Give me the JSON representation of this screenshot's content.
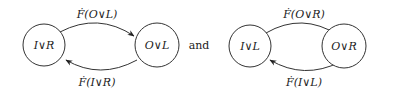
{
  "diagrams": [
    {
      "nodes": [
        {
          "label": "I∨R"
        },
        {
          "label": "O∨L"
        }
      ],
      "edges": [
        {
          "label": "Ḟ(O∨L)",
          "from": "I∨R",
          "to": "O∨L"
        },
        {
          "label": "Ḟ(I∨R)",
          "from": "O∨L",
          "to": "I∨R"
        }
      ]
    },
    {
      "nodes": [
        {
          "label": "I∨L"
        },
        {
          "label": "O∨R"
        }
      ],
      "edges": [
        {
          "label": "Ḟ(O∨R)",
          "from": "I∨L",
          "to": "O∨R"
        },
        {
          "label": "Ḟ(I∨L)",
          "from": "O∨R",
          "to": "I∨L"
        }
      ]
    }
  ],
  "connector": "and"
}
